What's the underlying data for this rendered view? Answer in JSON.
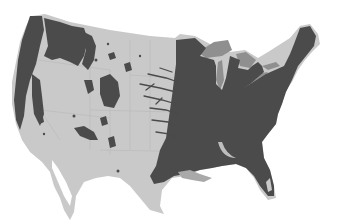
{
  "map": {
    "title": "",
    "region": "Contiguous United States",
    "colors": {
      "background": "#ffffff",
      "land": "#c9c9c9",
      "state_borders": "#b4b4b4",
      "forest": "#4b4b4b",
      "great_lakes": "#8f8f8f"
    },
    "layers": [
      {
        "name": "land",
        "label": ""
      },
      {
        "name": "forest-cover",
        "label": ""
      },
      {
        "name": "great-lakes",
        "label": ""
      }
    ]
  }
}
